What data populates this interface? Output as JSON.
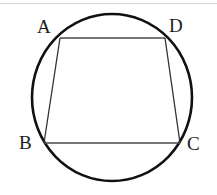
{
  "figure": {
    "background_color": "#ffffff",
    "stroke_color": "#111111",
    "chord_color": "#4a4a4a",
    "rule_color": "#d8d8dc"
  },
  "circle": {
    "name": "circumscribed-circle",
    "center_x": 112,
    "center_y": 97.5,
    "radius_x": 80,
    "radius_y": 83.5,
    "stroke_width": 2.6
  },
  "vertices": [
    {
      "id": "A",
      "label": "A",
      "x": 60,
      "y": 38,
      "label_x": 37,
      "label_y": 17
    },
    {
      "id": "D",
      "label": "D",
      "x": 165,
      "y": 38,
      "label_x": 169,
      "label_y": 16
    },
    {
      "id": "B",
      "label": "B",
      "x": 44,
      "y": 143,
      "label_x": 19,
      "label_y": 133
    },
    {
      "id": "C",
      "label": "C",
      "x": 180,
      "y": 143,
      "label_x": 187,
      "label_y": 134
    }
  ],
  "edges": [
    {
      "id": "AD",
      "label": "AD",
      "from": "A",
      "to": "D",
      "x1": 60,
      "y1": 38,
      "x2": 165,
      "y2": 38,
      "stroke_width": 1.6
    },
    {
      "id": "AB",
      "label": "AB",
      "from": "A",
      "to": "B",
      "x1": 60,
      "y1": 38,
      "x2": 44,
      "y2": 143,
      "stroke_width": 1.3
    },
    {
      "id": "DC",
      "label": "DC",
      "from": "D",
      "to": "C",
      "x1": 165,
      "y1": 38,
      "x2": 180,
      "y2": 143,
      "stroke_width": 1.3
    },
    {
      "id": "BC",
      "label": "BC",
      "from": "B",
      "to": "C",
      "x1": 44,
      "y1": 143,
      "x2": 180,
      "y2": 143,
      "stroke_width": 1.6
    }
  ]
}
